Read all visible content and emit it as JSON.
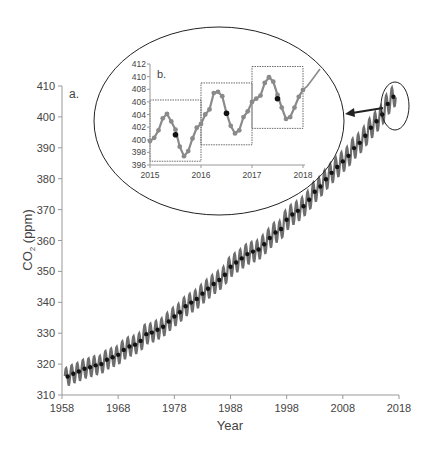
{
  "chart_data": [
    {
      "id": "main",
      "type": "line",
      "panel_label": "a.",
      "title": "",
      "xlabel": "Year",
      "ylabel": "CO2 (ppm)",
      "ylabel_main": "CO",
      "ylabel_sub": "2",
      "ylabel_rest": " (ppm)",
      "xlim": [
        1958,
        2018
      ],
      "ylim": [
        310,
        410
      ],
      "xticks": [
        1958,
        1968,
        1978,
        1988,
        1998,
        2008,
        2018
      ],
      "yticks": [
        310,
        320,
        330,
        340,
        350,
        360,
        370,
        380,
        390,
        400,
        410
      ],
      "grid": false,
      "series": [
        {
          "name": "Monthly CO2",
          "style": "gray line with markers, seasonal cycle ~±3 ppm",
          "color": "#7a7a7a"
        },
        {
          "name": "Annual mean",
          "style": "black dots",
          "color": "#111111",
          "x": [
            1959,
            1960,
            1961,
            1962,
            1963,
            1964,
            1965,
            1966,
            1967,
            1968,
            1969,
            1970,
            1971,
            1972,
            1973,
            1974,
            1975,
            1976,
            1977,
            1978,
            1979,
            1980,
            1981,
            1982,
            1983,
            1984,
            1985,
            1986,
            1987,
            1988,
            1989,
            1990,
            1991,
            1992,
            1993,
            1994,
            1995,
            1996,
            1997,
            1998,
            1999,
            2000,
            2001,
            2002,
            2003,
            2004,
            2005,
            2006,
            2007,
            2008,
            2009,
            2010,
            2011,
            2012,
            2013,
            2014,
            2015,
            2016,
            2017
          ],
          "values": [
            316.0,
            316.9,
            317.6,
            318.5,
            319.0,
            319.6,
            320.0,
            321.4,
            322.2,
            323.0,
            324.6,
            325.7,
            326.3,
            327.5,
            329.7,
            330.2,
            331.1,
            332.1,
            333.8,
            335.4,
            336.8,
            338.7,
            339.9,
            341.1,
            342.8,
            344.4,
            345.9,
            347.2,
            348.9,
            351.5,
            352.9,
            354.2,
            355.6,
            356.4,
            357.1,
            358.8,
            360.8,
            362.6,
            363.7,
            366.7,
            368.4,
            369.6,
            371.1,
            373.2,
            375.8,
            377.5,
            379.8,
            381.9,
            383.8,
            385.6,
            387.4,
            389.9,
            391.6,
            393.9,
            396.5,
            398.6,
            400.8,
            404.2,
            406.5
          ]
        }
      ],
      "annotations": [
        {
          "type": "ellipse",
          "target": "2015-2018 region",
          "note": "small ellipse around recent data"
        },
        {
          "type": "arrow",
          "from": "small ellipse",
          "to": "inset b."
        }
      ]
    },
    {
      "id": "inset",
      "type": "line",
      "panel_label": "b.",
      "xlim": [
        2015,
        2018
      ],
      "ylim": [
        396,
        412
      ],
      "xticks": [
        2015,
        2016,
        2017,
        2018
      ],
      "yticks": [
        396,
        398,
        400,
        402,
        404,
        406,
        408,
        410,
        412
      ],
      "grid": false,
      "series": [
        {
          "name": "Monthly CO2",
          "color": "#8a8a8a",
          "x": [
            2015.0,
            2015.083,
            2015.167,
            2015.25,
            2015.333,
            2015.417,
            2015.5,
            2015.583,
            2015.667,
            2015.75,
            2015.833,
            2015.917,
            2016.0,
            2016.083,
            2016.167,
            2016.25,
            2016.333,
            2016.417,
            2016.5,
            2016.583,
            2016.667,
            2016.75,
            2016.833,
            2016.917,
            2017.0,
            2017.083,
            2017.167,
            2017.25,
            2017.333,
            2017.417,
            2017.5,
            2017.583,
            2017.667,
            2017.75,
            2017.833,
            2017.917,
            2018.0
          ],
          "values": [
            399.8,
            400.3,
            401.5,
            403.4,
            404.1,
            402.9,
            401.6,
            398.9,
            397.4,
            398.2,
            400.2,
            401.9,
            402.5,
            404.0,
            404.8,
            407.4,
            407.6,
            406.9,
            404.2,
            402.2,
            401.0,
            401.5,
            403.6,
            404.5,
            406.0,
            406.5,
            407.0,
            409.0,
            409.9,
            409.2,
            407.1,
            405.1,
            403.3,
            403.6,
            405.1,
            406.8,
            407.9
          ]
        },
        {
          "name": "Monthly CO2 (line only, no markers)",
          "color": "#8a8a8a",
          "x": [
            2018.0,
            2018.083,
            2018.167,
            2018.25,
            2018.333
          ],
          "values": [
            407.9,
            408.5,
            409.4,
            410.3,
            411.2
          ]
        },
        {
          "name": "Annual mean",
          "color": "#111111",
          "x": [
            2015.5,
            2016.5,
            2017.5
          ],
          "values": [
            400.8,
            404.2,
            406.5
          ]
        }
      ],
      "boxes": [
        {
          "x0": 2015.0,
          "x1": 2016.0,
          "y0": 396.6,
          "y1": 406.3
        },
        {
          "x0": 2016.0,
          "x1": 2017.0,
          "y0": 399.2,
          "y1": 409.0
        },
        {
          "x0": 2017.0,
          "x1": 2018.0,
          "y0": 401.8,
          "y1": 411.6
        }
      ]
    }
  ],
  "labels": {
    "panel_a": "a.",
    "panel_b": "b.",
    "xlabel": "Year",
    "ylabel_co": "CO",
    "ylabel_sub": "2",
    "ylabel_rest": " (ppm)"
  }
}
